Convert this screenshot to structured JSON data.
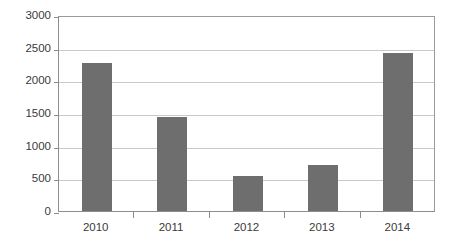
{
  "chart_data": {
    "type": "bar",
    "title": "",
    "subtitle": "",
    "xlabel": "",
    "ylabel": "",
    "categories": [
      "2010",
      "2011",
      "2012",
      "2013",
      "2014"
    ],
    "values": [
      2270,
      1440,
      535,
      700,
      2420
    ],
    "series": [
      {
        "name": "",
        "values": [
          2270,
          1440,
          535,
          700,
          2420
        ]
      }
    ],
    "ylim": [
      0,
      3000
    ],
    "ytick_values": [
      0,
      500,
      1000,
      1500,
      2000,
      2500,
      3000
    ],
    "ytick_labels": [
      "0",
      "500",
      "1000",
      "1500",
      "2000",
      "2500",
      "3000"
    ],
    "xtick_labels": [
      "2010",
      "2011",
      "2012",
      "2013",
      "2014"
    ],
    "grid": true,
    "grid_axis": "y",
    "legend": false,
    "legend_position": "none",
    "annotations": [],
    "bar_color": "#6e6e6e",
    "grid_color": "#c9c9c9",
    "axis_color": "#8d8d8d",
    "text_color": "#3a3a3a",
    "background_color": "#ffffff"
  }
}
